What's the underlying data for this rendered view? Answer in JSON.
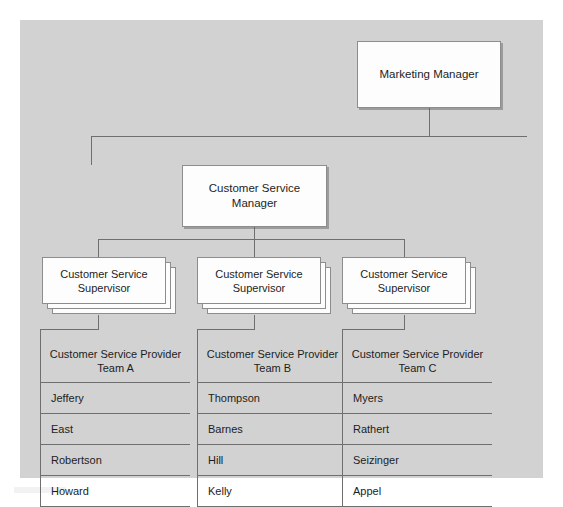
{
  "chart": {
    "type": "org-chart",
    "root": {
      "label": "Marketing Manager"
    },
    "manager": {
      "label": "Customer Service Manager",
      "line1": "Customer Service",
      "line2": "Manager"
    },
    "supervisor_label": {
      "line1": "Customer Service",
      "line2": "Supervisor"
    },
    "supervisors": [
      {
        "id": "a",
        "label": "Customer Service Supervisor",
        "stack_count": 3
      },
      {
        "id": "b",
        "label": "Customer Service Supervisor",
        "stack_count": 3
      },
      {
        "id": "c",
        "label": "Customer Service Supervisor",
        "stack_count": 3
      }
    ],
    "teams": [
      {
        "id": "a",
        "header_line1": "Customer Service Provider",
        "header_line2": "Team A",
        "members": [
          "Jeffery",
          "East",
          "Robertson",
          "Howard"
        ]
      },
      {
        "id": "b",
        "header_line1": "Customer Service Provider",
        "header_line2": "Team B",
        "members": [
          "Thompson",
          "Barnes",
          "Hill",
          "Kelly"
        ]
      },
      {
        "id": "c",
        "header_line1": "Customer Service Provider",
        "header_line2": "Team C",
        "members": [
          "Myers",
          "Rathert",
          "Seizinger",
          "Appel"
        ]
      }
    ],
    "colors": {
      "canvas": "#d2d2d2",
      "page": "#ffffff",
      "box_fill": "#fdfdfd",
      "line": "#6f6f6f",
      "border": "#8d8d8d",
      "text": "#1d1d1d"
    }
  }
}
